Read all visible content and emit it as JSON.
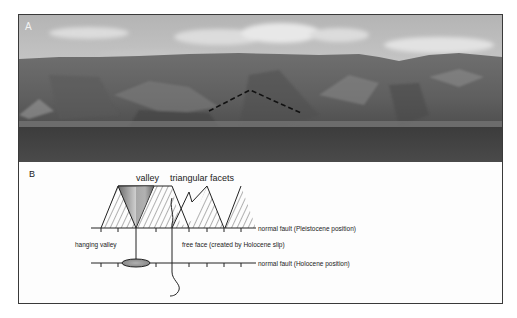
{
  "figure": {
    "panel_a": {
      "label": "A",
      "subject": "panoramic photo of mountain front above lake",
      "annotation": "dashed line outlining triangular facet"
    },
    "panel_b": {
      "label": "B",
      "labels": {
        "valley": "valley",
        "triangular_facets": "triangular facets",
        "hanging_valley": "hanging valley",
        "free_face": "free face (created by Holocene slip)",
        "fault_pleistocene": "normal fault (Pleistocene position)",
        "fault_holocene": "normal fault (Holocene position)"
      }
    }
  }
}
